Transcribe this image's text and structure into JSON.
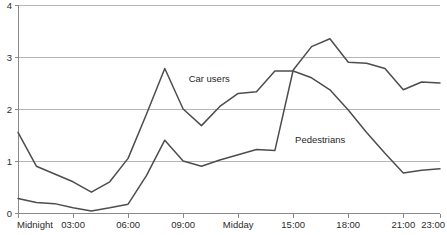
{
  "chart_data": {
    "type": "line",
    "title": "",
    "subtitle": "",
    "xlabel": "",
    "ylabel": "",
    "grid": "horizontal",
    "legend_position": "inline-annotations",
    "xlim": [
      0,
      23
    ],
    "ylim": [
      0,
      4
    ],
    "yticks": [
      "0",
      "1",
      "2",
      "3",
      "4"
    ],
    "ytick_values": [
      0,
      1,
      2,
      3,
      4
    ],
    "xticks": [
      "Midnight",
      "03:00",
      "06:00",
      "09:00",
      "Midday",
      "15:00",
      "18:00",
      "21:00",
      "23:00"
    ],
    "xtick_values": [
      0,
      3,
      6,
      9,
      12,
      15,
      18,
      21,
      23
    ],
    "x": [
      0,
      1,
      2,
      3,
      4,
      5,
      6,
      7,
      8,
      9,
      10,
      11,
      12,
      13,
      14,
      15,
      16,
      17,
      18,
      19,
      20,
      21,
      22,
      23
    ],
    "series": [
      {
        "name": "Car users",
        "color": "#4d4d4d",
        "label_x": 9.3,
        "label_y": 2.52,
        "values": [
          1.55,
          0.9,
          0.75,
          0.6,
          0.4,
          0.6,
          1.05,
          1.9,
          2.78,
          2.0,
          1.68,
          2.05,
          2.3,
          2.33,
          2.73,
          2.73,
          2.6,
          2.37,
          1.98,
          1.55,
          1.15,
          0.77,
          0.82,
          0.85
        ]
      },
      {
        "name": "Pedestrians",
        "color": "#4d4d4d",
        "label_x": 15.1,
        "label_y": 1.35,
        "values": [
          0.28,
          0.2,
          0.18,
          0.1,
          0.04,
          0.1,
          0.17,
          0.72,
          1.4,
          1.0,
          0.9,
          1.02,
          1.12,
          1.22,
          1.2,
          2.75,
          3.2,
          3.35,
          2.9,
          2.88,
          2.78,
          2.37,
          2.52,
          2.5
        ]
      }
    ]
  },
  "annotations": {
    "car_users_label": "Car users",
    "pedestrians_label": "Pedestrians"
  }
}
